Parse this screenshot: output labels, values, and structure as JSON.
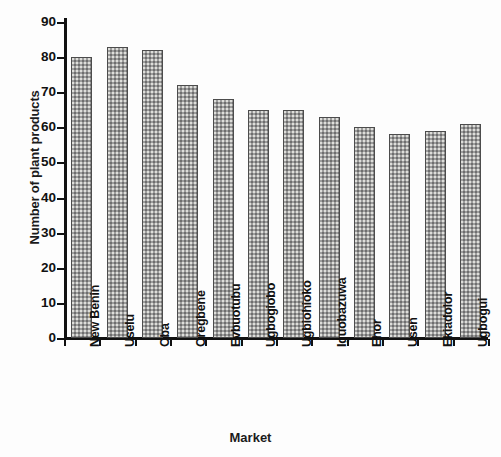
{
  "chart_data": {
    "type": "bar",
    "title": "",
    "xlabel": "Market",
    "ylabel": "Number of plant products",
    "categories": [
      "New Benin",
      "Uselu",
      "Oba",
      "Oregbene",
      "Evbuotubu",
      "Ugbogiobo",
      "Ugbiohioko",
      "Iguobazuwa",
      "Ehor",
      "Usen",
      "Ekiadolor",
      "Ugbogui"
    ],
    "values": [
      80,
      83,
      82,
      72,
      68,
      65,
      65,
      63,
      60,
      58,
      59,
      61
    ],
    "ylim": [
      0,
      90
    ],
    "ytick_labels": [
      "0",
      "10",
      "20",
      "30",
      "40",
      "50",
      "60",
      "70",
      "80",
      "90"
    ],
    "ytick_values": [
      0,
      10,
      20,
      30,
      40,
      50,
      60,
      70,
      80,
      90
    ],
    "grid": false,
    "legend": null,
    "legend_position": "none",
    "bar_fill_color": "#9d9d9d",
    "bar_edge_color": "#4c4c4c",
    "axis_color": "#111111",
    "background_color": "#fdfdfd",
    "xtick_label_rotation": -90
  }
}
